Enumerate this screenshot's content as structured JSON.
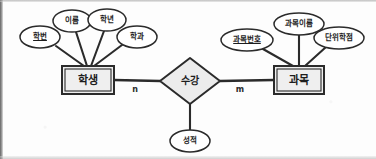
{
  "diagram": {
    "type": "entity-relationship-diagram",
    "notation": "chen",
    "title": "",
    "background_color": "#fdfdfd",
    "line_color": "#2b2b2b",
    "shape_fill": "#f0f0f0",
    "text_color": "#1d1d1d"
  },
  "entities": [
    {
      "id": "student",
      "label": "학생",
      "shape": "rectangle",
      "double_border": true,
      "x": 62,
      "y": 66,
      "width": 52,
      "height": 28
    },
    {
      "id": "subject",
      "label": "과목",
      "shape": "rectangle",
      "double_border": true,
      "x": 274,
      "y": 66,
      "width": 50,
      "height": 28
    }
  ],
  "relationships": [
    {
      "id": "enrollment",
      "label": "수강",
      "shape": "diamond",
      "x": 160,
      "y": 58,
      "width": 60,
      "height": 46
    }
  ],
  "attributes": [
    {
      "id": "student-id",
      "label": "학번",
      "owner": "student",
      "is_key": true,
      "cx": 40,
      "cy": 37,
      "rx": 20,
      "ry": 11
    },
    {
      "id": "student-name",
      "label": "이름",
      "owner": "student",
      "is_key": false,
      "cx": 72,
      "cy": 21,
      "rx": 19,
      "ry": 11
    },
    {
      "id": "school-year",
      "label": "학년",
      "owner": "student",
      "is_key": false,
      "cx": 107,
      "cy": 20,
      "rx": 19,
      "ry": 11
    },
    {
      "id": "department",
      "label": "학과",
      "owner": "student",
      "is_key": false,
      "cx": 137,
      "cy": 37,
      "rx": 20,
      "ry": 11
    },
    {
      "id": "subject-no",
      "label": "과목번호",
      "owner": "subject",
      "is_key": true,
      "cx": 247,
      "cy": 40,
      "rx": 26,
      "ry": 11
    },
    {
      "id": "subject-name",
      "label": "과목이름",
      "owner": "subject",
      "is_key": false,
      "cx": 299,
      "cy": 24,
      "rx": 25,
      "ry": 11
    },
    {
      "id": "credit",
      "label": "단위학점",
      "owner": "subject",
      "is_key": false,
      "cx": 339,
      "cy": 38,
      "rx": 25,
      "ry": 11
    },
    {
      "id": "score",
      "label": "성적",
      "owner": "enrollment",
      "is_key": false,
      "cx": 190,
      "cy": 141,
      "rx": 20,
      "ry": 11
    }
  ],
  "cardinalities": [
    {
      "id": "card-n",
      "label": "n",
      "x": 135,
      "y": 90,
      "side": "left"
    },
    {
      "id": "card-m",
      "label": "m",
      "x": 240,
      "y": 90,
      "side": "right"
    }
  ],
  "connections": [
    {
      "from": "student",
      "to": "enrollment",
      "kind": "relationship-line"
    },
    {
      "from": "enrollment",
      "to": "subject",
      "kind": "relationship-line"
    },
    {
      "from": "enrollment",
      "to": "score",
      "kind": "attribute-line"
    },
    {
      "from": "student",
      "to": "student-id",
      "kind": "attribute-line"
    },
    {
      "from": "student",
      "to": "student-name",
      "kind": "attribute-line"
    },
    {
      "from": "student",
      "to": "school-year",
      "kind": "attribute-line"
    },
    {
      "from": "student",
      "to": "department",
      "kind": "attribute-line"
    },
    {
      "from": "subject",
      "to": "subject-no",
      "kind": "attribute-line"
    },
    {
      "from": "subject",
      "to": "subject-name",
      "kind": "attribute-line"
    },
    {
      "from": "subject",
      "to": "credit",
      "kind": "attribute-line"
    }
  ]
}
